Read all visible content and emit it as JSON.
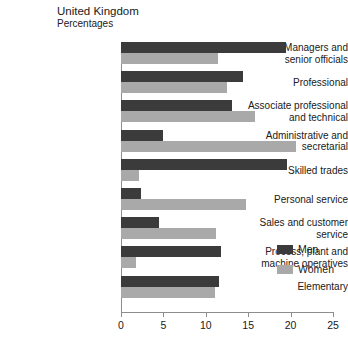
{
  "chart_data": {
    "type": "bar",
    "orientation": "horizontal",
    "title": "United Kingdom",
    "subtitle": "Percentages",
    "xlabel": "",
    "ylabel": "",
    "xlim": [
      0,
      25
    ],
    "xticks": [
      0,
      5,
      10,
      15,
      20,
      25
    ],
    "grid": false,
    "legend_position": "right",
    "categories": [
      "Managers and senior officials",
      "Professional",
      "Associate professional and technical",
      "Administrative and secretarial",
      "Skilled trades",
      "Personal service",
      "Sales and customer service",
      "Process, plant and machine operatives",
      "Elementary"
    ],
    "category_lines": [
      [
        "Managers and",
        "senior officials"
      ],
      [
        "Professional"
      ],
      [
        "Associate professional",
        "and technical"
      ],
      [
        "Administrative and",
        "secretarial"
      ],
      [
        "Skilled trades"
      ],
      [
        "Personal service"
      ],
      [
        "Sales and customer",
        "service"
      ],
      [
        "Process, plant and",
        "machine operatives"
      ],
      [
        "Elementary"
      ]
    ],
    "series": [
      {
        "name": "Men",
        "color": "#3b3b3b",
        "values": [
          19.5,
          14.4,
          13.1,
          4.9,
          19.6,
          2.3,
          4.5,
          11.8,
          11.6
        ]
      },
      {
        "name": "Women",
        "color": "#a9a9a9",
        "values": [
          11.4,
          12.5,
          15.8,
          20.6,
          2.1,
          14.7,
          11.2,
          1.8,
          11.1
        ]
      }
    ]
  },
  "legend": {
    "items": [
      {
        "label": "Men"
      },
      {
        "label": "Women"
      }
    ]
  }
}
